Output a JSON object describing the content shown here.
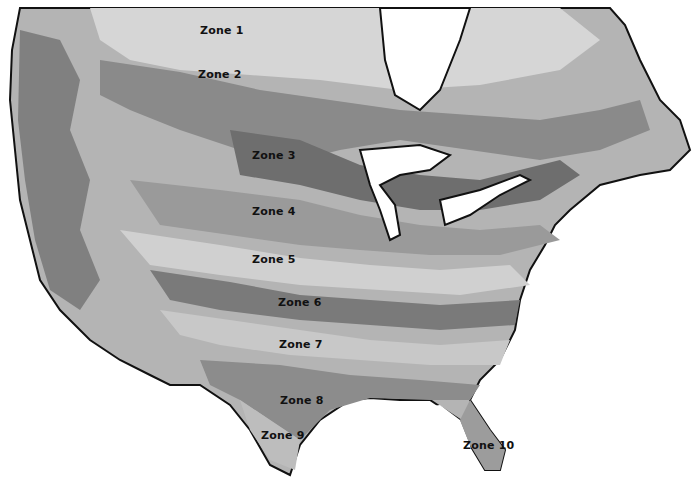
{
  "map": {
    "type": "plant hardiness zone map (grayscale)",
    "region": "United States and southern Canada",
    "zones": [
      {
        "label": "Zone 1",
        "x": 200,
        "y": 24
      },
      {
        "label": "Zone 2",
        "x": 198,
        "y": 68
      },
      {
        "label": "Zone 3",
        "x": 252,
        "y": 149
      },
      {
        "label": "Zone 4",
        "x": 252,
        "y": 205
      },
      {
        "label": "Zone 5",
        "x": 252,
        "y": 253
      },
      {
        "label": "Zone 6",
        "x": 278,
        "y": 296
      },
      {
        "label": "Zone 7",
        "x": 279,
        "y": 338
      },
      {
        "label": "Zone 8",
        "x": 280,
        "y": 394
      },
      {
        "label": "Zone 9",
        "x": 261,
        "y": 429
      },
      {
        "label": "Zone 10",
        "x": 463,
        "y": 439
      }
    ],
    "colors": {
      "background": "#ffffff",
      "light": "#d4d4d4",
      "mid": "#a8a8a8",
      "dark": "#7c7c7c",
      "darker": "#5e5e5e",
      "border": "#111111"
    }
  }
}
